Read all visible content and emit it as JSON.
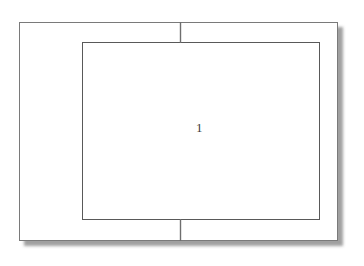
{
  "figure": {
    "kind": "technical-line-drawing",
    "background_color": "#ffffff",
    "outer_frame": {
      "name": "outer-rectangle",
      "stroke_color": "#7a7a7a",
      "fill_color": "#ffffff",
      "stroke_width": 1,
      "x": 19,
      "y": 22,
      "width": 319,
      "height": 219
    },
    "shadow": {
      "name": "drop-shadow",
      "color": "#8c8c8c",
      "offset_x": 4,
      "offset_y": 4,
      "blur": 2
    },
    "inner_frame": {
      "name": "inner-rectangle",
      "stroke_color": "#595959",
      "fill_color": "#ffffff",
      "stroke_width": 1,
      "x": 82,
      "y": 42,
      "width": 238,
      "height": 178
    },
    "connectors": [
      {
        "name": "top-divider-tick",
        "orientation": "vertical",
        "x": 180,
        "y1": 22,
        "y2": 42,
        "stroke_color": "#6e6e6e"
      },
      {
        "name": "bottom-divider-tick",
        "orientation": "vertical",
        "x": 180,
        "y1": 220,
        "y2": 241,
        "stroke_color": "#6e6e6e"
      }
    ],
    "labels": [
      {
        "name": "reference-numeral-1",
        "text": "1",
        "x": 196,
        "y": 121,
        "color": "#3c3c3c",
        "font_size": 13
      }
    ]
  }
}
